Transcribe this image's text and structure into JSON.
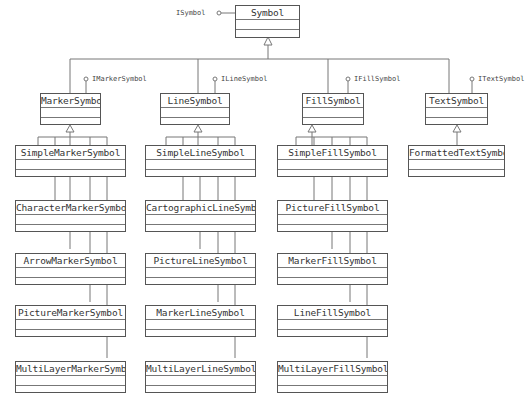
{
  "diagram": {
    "root": {
      "name": "Symbol",
      "interface": "ISymbol"
    },
    "branches": [
      {
        "name": "MarkerSymbol",
        "interface": "IMarkerSymbol",
        "children": [
          "SimpleMarkerSymbol",
          "CharacterMarkerSymbol",
          "ArrowMarkerSymbol",
          "PictureMarkerSymbol",
          "MultiLayerMarkerSymbol"
        ]
      },
      {
        "name": "LineSymbol",
        "interface": "ILineSymbol",
        "children": [
          "SimpleLineSymbol",
          "CartographicLineSymbol",
          "PictureLineSymbol",
          "MarkerLineSymbol",
          "MultiLayerLineSymbol"
        ]
      },
      {
        "name": "FillSymbol",
        "interface": "IFillSymbol",
        "children": [
          "SimpleFillSymbol",
          "PictureFillSymbol",
          "MarkerFillSymbol",
          "LineFillSymbol",
          "MultiLayerFillSymbol"
        ]
      },
      {
        "name": "TextSymbol",
        "interface": "ITextSymbol",
        "children": [
          "FormattedTextSymbol"
        ]
      }
    ],
    "colors": {
      "line": "#555555",
      "text": "#333333",
      "background": "#ffffff"
    }
  }
}
